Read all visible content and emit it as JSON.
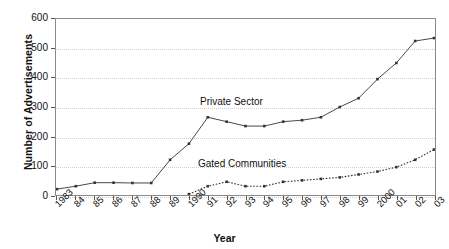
{
  "chart_data": {
    "type": "line",
    "title": "",
    "xlabel": "Year",
    "ylabel": "Number of Advertisements",
    "grid": "horizontal dotted gridlines",
    "legend_position": "inline annotations on plot",
    "ylim": [
      0,
      600
    ],
    "yticks": [
      0,
      100,
      200,
      300,
      400,
      500,
      600
    ],
    "categories": [
      "1983",
      "84",
      "85",
      "86",
      "87",
      "88",
      "89",
      "1990",
      "91",
      "92",
      "93",
      "94",
      "95",
      "96",
      "97",
      "98",
      "99",
      "2000",
      "01",
      "02",
      "03"
    ],
    "x": [
      1983,
      1984,
      1985,
      1986,
      1987,
      1988,
      1989,
      1990,
      1991,
      1992,
      1993,
      1994,
      1995,
      1996,
      1997,
      1998,
      1999,
      2000,
      2001,
      2002,
      2003
    ],
    "series": [
      {
        "name": "Private Sector",
        "style": "solid",
        "marker": "filled-diamond",
        "color": "#333333",
        "values": [
          20,
          30,
          42,
          42,
          41,
          41,
          120,
          175,
          265,
          250,
          235,
          235,
          250,
          255,
          265,
          300,
          330,
          395,
          450,
          525,
          535
        ]
      },
      {
        "name": "Gated Communities",
        "style": "dotted",
        "marker": "filled-diamond",
        "color": "#333333",
        "values": [
          null,
          null,
          null,
          null,
          null,
          null,
          null,
          3,
          30,
          45,
          30,
          30,
          45,
          50,
          55,
          60,
          70,
          80,
          95,
          120,
          155
        ]
      }
    ],
    "annotations": [
      {
        "text": "Private Sector",
        "series": "Private Sector"
      },
      {
        "text": "Gated Communities",
        "series": "Gated Communities"
      }
    ]
  },
  "axis": {
    "y_title": "Number of Advertisements",
    "x_title": "Year"
  }
}
